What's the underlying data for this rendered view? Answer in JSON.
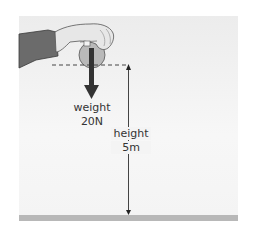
{
  "diagram": {
    "weight_label": "weight",
    "weight_value": "20N",
    "height_label": "height",
    "height_value": "5m"
  },
  "colors": {
    "background": "#f2f2f2",
    "floor": "#b8b8b8",
    "arrow": "#333333",
    "text": "#333333"
  }
}
